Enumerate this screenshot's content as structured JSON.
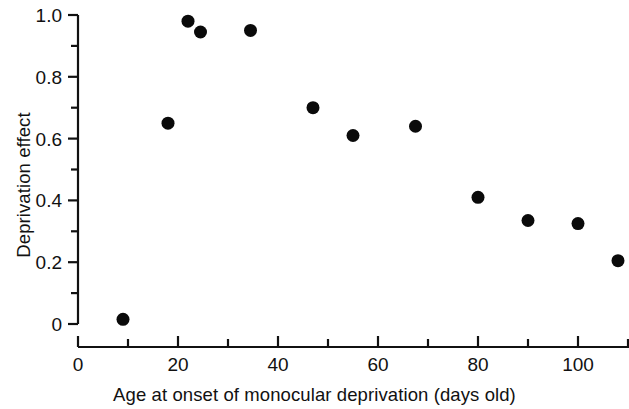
{
  "chart_data": {
    "type": "scatter",
    "title": "",
    "xlabel": "Age at onset of monocular deprivation (days old)",
    "ylabel": "Deprivation effect",
    "xlim": [
      0,
      112
    ],
    "ylim": [
      0,
      1.0
    ],
    "grid": false,
    "legend": null,
    "marker": {
      "shape": "circle",
      "color": "#0a0a0a",
      "size_px": 13
    },
    "x_ticks_major": [
      0,
      20,
      40,
      60,
      80,
      100
    ],
    "x_ticks_major_labels": [
      "0",
      "20",
      "40",
      "60",
      "80",
      "100"
    ],
    "x_ticks_minor": [
      10,
      30,
      50,
      70,
      90,
      110
    ],
    "y_ticks_major": [
      0,
      0.2,
      0.4,
      0.6,
      0.8,
      1.0
    ],
    "y_ticks_major_labels": [
      "0",
      "0.2",
      "0.4",
      "0.6",
      "0.8",
      "1.0"
    ],
    "y_ticks_minor": [
      0.1,
      0.3,
      0.5,
      0.7,
      0.9
    ],
    "x": [
      9,
      18,
      22,
      24.5,
      34.5,
      47,
      55,
      67.5,
      80,
      90,
      100,
      108
    ],
    "y": [
      0.015,
      0.65,
      0.98,
      0.945,
      0.95,
      0.7,
      0.61,
      0.64,
      0.41,
      0.335,
      0.325,
      0.205
    ],
    "points": [
      {
        "x": 9,
        "y": 0.015
      },
      {
        "x": 18,
        "y": 0.65
      },
      {
        "x": 22,
        "y": 0.98
      },
      {
        "x": 24.5,
        "y": 0.945
      },
      {
        "x": 34.5,
        "y": 0.95
      },
      {
        "x": 47,
        "y": 0.7
      },
      {
        "x": 55,
        "y": 0.61
      },
      {
        "x": 67.5,
        "y": 0.64
      },
      {
        "x": 80,
        "y": 0.41
      },
      {
        "x": 90,
        "y": 0.335
      },
      {
        "x": 100,
        "y": 0.325
      },
      {
        "x": 108,
        "y": 0.205
      }
    ]
  },
  "axes": {
    "x_title": "Age at onset of monocular deprivation (days old)",
    "y_title": "Deprivation effect"
  }
}
